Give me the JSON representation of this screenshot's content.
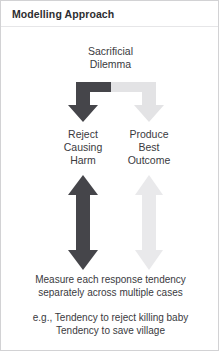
{
  "slide": {
    "title": "Modelling Approach",
    "background_color": "#ffffff",
    "border_color": "#d2d2d4"
  },
  "diagram": {
    "type": "flow-diagram",
    "source_node": {
      "lines": [
        "Sacrificial",
        "Dilemma"
      ]
    },
    "branches": [
      {
        "id": "reject-causing-harm",
        "side": "left",
        "lines": [
          "Reject",
          "Causing",
          "Harm"
        ],
        "color": "#45454a",
        "branch_arrow": "elbow-down-left-arrow",
        "measure_arrow": "double-headed-vertical-arrow"
      },
      {
        "id": "produce-best-outcome",
        "side": "right",
        "lines": [
          "Produce",
          "Best",
          "Outcome"
        ],
        "color": "#e3e3e5",
        "branch_arrow": "elbow-down-right-arrow",
        "measure_arrow": "double-headed-vertical-arrow"
      }
    ]
  },
  "notes": {
    "measure": [
      "Measure each response tendency",
      "separately across multiple cases"
    ],
    "example": [
      "e.g., Tendency to reject killing baby",
      "Tendency to save village"
    ]
  }
}
